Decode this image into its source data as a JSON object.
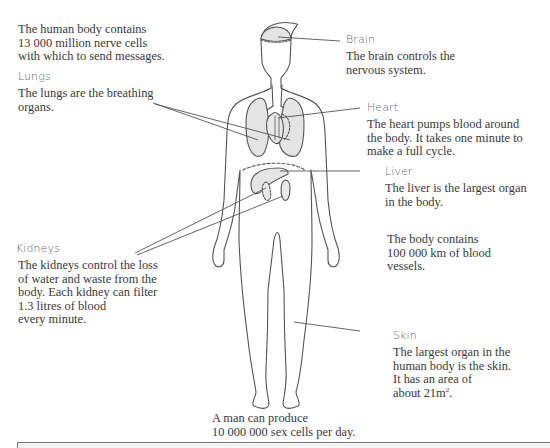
{
  "diagram": {
    "title": "The human body",
    "intro": {
      "text": "The human body contains\n13 000 million nerve cells\nwith which to send messages."
    },
    "callouts": [
      {
        "id": "brain",
        "label": "Brain",
        "text": "The brain controls the\nnervous system."
      },
      {
        "id": "lungs",
        "label": "Lungs",
        "text": "The lungs are the breathing\norgans."
      },
      {
        "id": "heart",
        "label": "Heart",
        "text": "The heart pumps blood around\nthe body. It takes one minute to\nmake a full cycle."
      },
      {
        "id": "liver",
        "label": "Liver",
        "text": "The liver is the largest organ\nin the body."
      },
      {
        "id": "kidneys",
        "label": "Kidneys",
        "text": "The kidneys control the loss\nof water and waste from the\nbody. Each kidney can filter\n1.3 litres of blood\nevery minute."
      },
      {
        "id": "skin",
        "label": "Skin",
        "text_main": "The largest organ in the\nhuman body is the skin.\nIt has an area of\nabout 21m",
        "text_sup": "2",
        "text_end": "."
      }
    ],
    "facts": {
      "blood_vessels": "The body contains\n100 000 km of blood\nvessels.",
      "sex_cells": "A man can produce\n10 000 000 sex cells per day."
    },
    "colors": {
      "outline": "#555555",
      "organ_fill": "#e4e4e4",
      "leader_line": "#555555",
      "label_text": "#666666",
      "body_text": "#3a3a3a"
    }
  }
}
